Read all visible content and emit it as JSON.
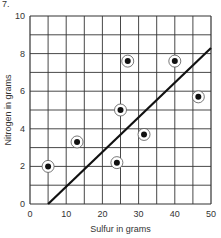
{
  "figure_label": "7.",
  "chart_data": {
    "type": "scatter",
    "title": "",
    "xlabel": "Sulfur in grams",
    "ylabel": "Nitrogen in grams",
    "xlim": [
      0,
      50
    ],
    "ylim": [
      0,
      10
    ],
    "x_ticks": [
      0,
      10,
      20,
      30,
      40,
      50
    ],
    "y_ticks": [
      0,
      2,
      4,
      6,
      8,
      10
    ],
    "grid": true,
    "grid_x_step": 5,
    "grid_y_step": 1,
    "series": [
      {
        "name": "data points",
        "marker": "circled-dot",
        "points": [
          {
            "x": 5,
            "y": 2.0
          },
          {
            "x": 13,
            "y": 3.3
          },
          {
            "x": 24,
            "y": 2.2
          },
          {
            "x": 25,
            "y": 5.0
          },
          {
            "x": 27,
            "y": 7.6
          },
          {
            "x": 31.5,
            "y": 3.7
          },
          {
            "x": 40,
            "y": 7.6
          },
          {
            "x": 46.5,
            "y": 5.7
          }
        ]
      }
    ],
    "line": {
      "name": "fitted line",
      "x1": 5,
      "y1": 0,
      "x2": 50,
      "y2": 8.3
    }
  }
}
